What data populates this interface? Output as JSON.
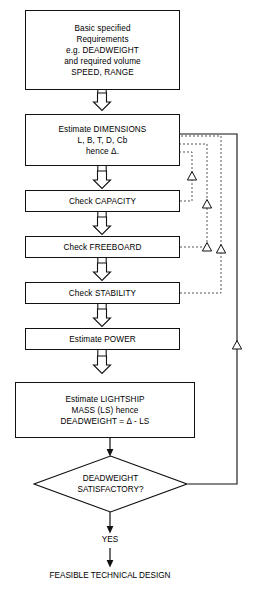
{
  "diagram": {
    "nodes": [
      {
        "id": "requirements",
        "name": "requirements-box",
        "shape": "process",
        "lines": [
          "Basic specified",
          "Requirements",
          "e.g. DEADWEIGHT",
          "and required volume",
          "SPEED, RANGE"
        ]
      },
      {
        "id": "dimensions",
        "name": "estimate-dimensions-box",
        "shape": "process",
        "lines": [
          "Estimate DIMENSIONS",
          "L, B, T, D, Cb",
          "hence Δ."
        ]
      },
      {
        "id": "capacity",
        "name": "check-capacity-box",
        "shape": "process",
        "lines": [
          "Check CAPACITY"
        ]
      },
      {
        "id": "freeboard",
        "name": "check-freeboard-box",
        "shape": "process",
        "lines": [
          "Check FREEBOARD"
        ]
      },
      {
        "id": "stability",
        "name": "check-stability-box",
        "shape": "process",
        "lines": [
          "Check STABILITY"
        ]
      },
      {
        "id": "power",
        "name": "estimate-power-box",
        "shape": "process",
        "lines": [
          "Estimate POWER"
        ]
      },
      {
        "id": "lightship",
        "name": "estimate-lightship-box",
        "shape": "process",
        "lines": [
          "Estimate LIGHTSHIP",
          "MASS (LS)  hence",
          "DEADWEIGHT = Δ - LS"
        ]
      },
      {
        "id": "decision",
        "name": "deadweight-satisfactory-decision",
        "shape": "decision",
        "lines": [
          "DEADWEIGHT",
          "SATISFACTORY?"
        ]
      }
    ],
    "labels": {
      "yes": "YES",
      "outcome": "FEASIBLE TECHNICAL DESIGN"
    },
    "feedback_loops": [
      {
        "id": "loop-capacity",
        "name": "capacity-feedback-loop",
        "style": "dashed",
        "from": "Check CAPACITY",
        "to": "Estimate DIMENSIONS"
      },
      {
        "id": "loop-freeboard",
        "name": "freeboard-feedback-loop",
        "style": "dashed",
        "from": "Check FREEBOARD",
        "to": "Estimate DIMENSIONS"
      },
      {
        "id": "loop-stability",
        "name": "stability-feedback-loop",
        "style": "dashed",
        "from": "Check STABILITY",
        "to": "Estimate DIMENSIONS"
      },
      {
        "id": "loop-deadweight",
        "name": "deadweight-feedback-loop",
        "style": "solid",
        "from": "DEADWEIGHT SATISFACTORY?",
        "to": "Estimate DIMENSIONS"
      }
    ],
    "colors": {
      "stroke": "#111111",
      "background": "#ffffff",
      "text": "#000000",
      "dashed_stroke": "#555555"
    }
  }
}
